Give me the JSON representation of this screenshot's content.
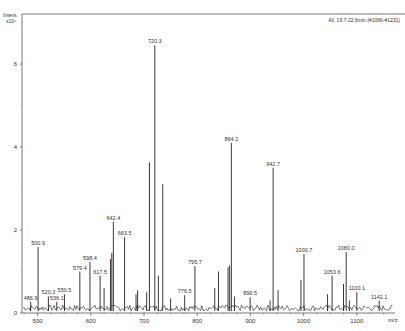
{
  "chart_data": {
    "type": "line",
    "title": "",
    "header": "All, 19.7-22.6min (#1066-#1231)",
    "ylabel": "Intens.",
    "yscale_label": "x10⁶",
    "xlabel": "m/z",
    "xlim": [
      465,
      1160
    ],
    "ylim": [
      0,
      7.2
    ],
    "x_ticks": [
      500,
      600,
      700,
      800,
      900,
      1000,
      1100
    ],
    "y_ticks": [
      0,
      2,
      4,
      6
    ],
    "grid": false,
    "series": [
      {
        "name": "spectrum",
        "peaks": [
          {
            "mz": 486.9,
            "intensity": 0.27,
            "label": "486.9"
          },
          {
            "mz": 500.9,
            "intensity": 1.59,
            "label": "500.9"
          },
          {
            "mz": 520.3,
            "intensity": 0.4,
            "label": "520.3"
          },
          {
            "mz": 536.1,
            "intensity": 0.27,
            "label": "536.1"
          },
          {
            "mz": 550.5,
            "intensity": 0.45,
            "label": "550.5"
          },
          {
            "mz": 579.4,
            "intensity": 1.0,
            "label": "579.4"
          },
          {
            "mz": 598.4,
            "intensity": 1.23,
            "label": "598.4"
          },
          {
            "mz": 617.5,
            "intensity": 0.9,
            "label": "617.5"
          },
          {
            "mz": 625.0,
            "intensity": 0.6,
            "label": ""
          },
          {
            "mz": 637.0,
            "intensity": 1.3,
            "label": ""
          },
          {
            "mz": 639.5,
            "intensity": 1.45,
            "label": ""
          },
          {
            "mz": 642.4,
            "intensity": 2.2,
            "label": "642.4"
          },
          {
            "mz": 663.5,
            "intensity": 1.83,
            "label": "663.5"
          },
          {
            "mz": 685.0,
            "intensity": 0.45,
            "label": ""
          },
          {
            "mz": 688.0,
            "intensity": 0.55,
            "label": ""
          },
          {
            "mz": 705.0,
            "intensity": 0.5,
            "label": ""
          },
          {
            "mz": 710.2,
            "intensity": 3.63,
            "label": ""
          },
          {
            "mz": 720.3,
            "intensity": 6.45,
            "label": "720.3"
          },
          {
            "mz": 727.0,
            "intensity": 0.9,
            "label": ""
          },
          {
            "mz": 735.2,
            "intensity": 3.1,
            "label": ""
          },
          {
            "mz": 750.0,
            "intensity": 0.35,
            "label": ""
          },
          {
            "mz": 776.5,
            "intensity": 0.43,
            "label": "776.5"
          },
          {
            "mz": 795.7,
            "intensity": 1.13,
            "label": "795.7"
          },
          {
            "mz": 833.0,
            "intensity": 0.6,
            "label": ""
          },
          {
            "mz": 840.0,
            "intensity": 1.0,
            "label": ""
          },
          {
            "mz": 858.0,
            "intensity": 1.1,
            "label": ""
          },
          {
            "mz": 861.0,
            "intensity": 1.15,
            "label": ""
          },
          {
            "mz": 864.2,
            "intensity": 4.1,
            "label": "864.2"
          },
          {
            "mz": 870.0,
            "intensity": 0.4,
            "label": ""
          },
          {
            "mz": 899.5,
            "intensity": 0.38,
            "label": "899.5"
          },
          {
            "mz": 937.0,
            "intensity": 0.3,
            "label": ""
          },
          {
            "mz": 942.7,
            "intensity": 3.5,
            "label": "942.7"
          },
          {
            "mz": 952.0,
            "intensity": 0.55,
            "label": ""
          },
          {
            "mz": 995.0,
            "intensity": 0.8,
            "label": ""
          },
          {
            "mz": 1000.7,
            "intensity": 1.42,
            "label": "1000.7"
          },
          {
            "mz": 1045.0,
            "intensity": 0.45,
            "label": ""
          },
          {
            "mz": 1053.6,
            "intensity": 0.9,
            "label": "1053.6"
          },
          {
            "mz": 1075.0,
            "intensity": 0.7,
            "label": ""
          },
          {
            "mz": 1080.0,
            "intensity": 1.47,
            "label": "1080.0"
          },
          {
            "mz": 1086.0,
            "intensity": 0.3,
            "label": ""
          },
          {
            "mz": 1100.1,
            "intensity": 0.5,
            "label": "1100.1"
          },
          {
            "mz": 1142.1,
            "intensity": 0.3,
            "label": "1142.1"
          }
        ]
      }
    ]
  }
}
